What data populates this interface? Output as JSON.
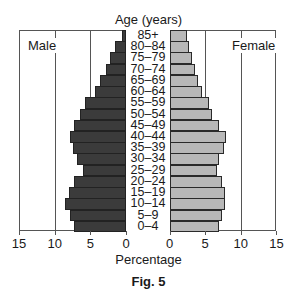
{
  "chart_data": {
    "type": "bar",
    "subtype": "population-pyramid",
    "title": "Age (years)",
    "xlabel": "Percentage",
    "caption": "Fig. 5",
    "categories": [
      "85+",
      "80–84",
      "75–79",
      "70–74",
      "65–69",
      "60–64",
      "55–59",
      "50–54",
      "45–49",
      "40–44",
      "35–39",
      "30–34",
      "25–29",
      "20–24",
      "15–19",
      "10–14",
      "5–9",
      "0–4"
    ],
    "series": [
      {
        "name": "Male",
        "color": "#3b3b3b",
        "side": "left",
        "values": [
          0.6,
          1.5,
          2.3,
          2.8,
          3.6,
          4.4,
          5.7,
          6.4,
          7.3,
          7.8,
          7.4,
          6.9,
          6.1,
          7.3,
          8.0,
          8.5,
          7.9,
          7.3
        ]
      },
      {
        "name": "Female",
        "color": "#b8b8b8",
        "side": "right",
        "values": [
          2.4,
          2.7,
          3.2,
          3.5,
          4.0,
          4.5,
          5.6,
          6.0,
          7.0,
          7.9,
          7.6,
          7.0,
          6.6,
          7.3,
          7.8,
          7.8,
          7.3,
          7.0
        ]
      }
    ],
    "x_ticks_left": [
      "15",
      "10",
      "5",
      "0"
    ],
    "x_ticks_right": [
      "0",
      "5",
      "10",
      "15"
    ],
    "xlim": [
      0,
      15
    ],
    "grid": true,
    "gridlines_at": [
      5,
      10
    ],
    "legend": {
      "left_label": "Male",
      "right_label": "Female",
      "position": "top inside"
    }
  }
}
